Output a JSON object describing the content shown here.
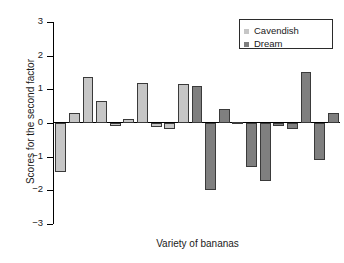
{
  "chart_data": {
    "type": "bar",
    "title": "",
    "xlabel": "Variety of bananas",
    "ylabel": "Scores for the second factor",
    "ylim": [
      -3,
      3
    ],
    "yticks": [
      3,
      2,
      1,
      0,
      -1,
      -2,
      -3
    ],
    "ytick_labels": [
      "3",
      "2",
      "1",
      "0",
      "−1",
      "−2",
      "−3"
    ],
    "grid": false,
    "legend_position": "top-right",
    "legend": [
      {
        "label": "Cavendish",
        "color": "#c6c6c6"
      },
      {
        "label": "Dream",
        "color": "#7f7f7f"
      }
    ],
    "series": [
      {
        "name": "Cavendish",
        "color": "#c6c6c6",
        "values": [
          -1.47,
          0.3,
          1.36,
          0.65,
          -0.04,
          0.12,
          1.2,
          -0.13,
          -0.18,
          1.15
        ]
      },
      {
        "name": "Dream",
        "color": "#7f7f7f",
        "values": [
          1.11,
          -1.99,
          0.43,
          0.03,
          -1.31,
          -1.73,
          -0.04,
          -0.17,
          1.52,
          -1.09,
          0.31
        ]
      }
    ],
    "bars": [
      {
        "index": 0,
        "series": "Cavendish",
        "value": -1.47
      },
      {
        "index": 1,
        "series": "Cavendish",
        "value": 0.3
      },
      {
        "index": 2,
        "series": "Cavendish",
        "value": 1.36
      },
      {
        "index": 3,
        "series": "Cavendish",
        "value": 0.65
      },
      {
        "index": 4,
        "series": "Cavendish",
        "value": -0.04
      },
      {
        "index": 5,
        "series": "Cavendish",
        "value": 0.12
      },
      {
        "index": 6,
        "series": "Cavendish",
        "value": 1.2
      },
      {
        "index": 7,
        "series": "Cavendish",
        "value": -0.13
      },
      {
        "index": 8,
        "series": "Cavendish",
        "value": -0.18
      },
      {
        "index": 9,
        "series": "Cavendish",
        "value": 1.15
      },
      {
        "index": 10,
        "series": "Dream",
        "value": 1.11
      },
      {
        "index": 11,
        "series": "Dream",
        "value": -1.99
      },
      {
        "index": 12,
        "series": "Dream",
        "value": 0.43
      },
      {
        "index": 13,
        "series": "Dream",
        "value": 0.03
      },
      {
        "index": 14,
        "series": "Dream",
        "value": -1.31
      },
      {
        "index": 15,
        "series": "Dream",
        "value": -1.73
      },
      {
        "index": 16,
        "series": "Dream",
        "value": -0.04
      },
      {
        "index": 17,
        "series": "Dream",
        "value": -0.17
      },
      {
        "index": 18,
        "series": "Dream",
        "value": 1.52
      },
      {
        "index": 19,
        "series": "Dream",
        "value": -1.09
      },
      {
        "index": 20,
        "series": "Dream",
        "value": 0.31
      }
    ]
  }
}
